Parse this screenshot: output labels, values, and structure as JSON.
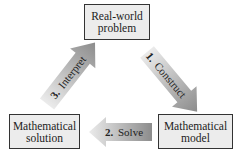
{
  "nodes": {
    "top": {
      "line1": "Real-world",
      "line2": "problem"
    },
    "right": {
      "line1": "Mathematical",
      "line2": "model"
    },
    "left": {
      "line1": "Mathematical",
      "line2": "solution"
    }
  },
  "arrows": {
    "construct": {
      "num": "1.",
      "label": "Construct"
    },
    "solve": {
      "num": "2.",
      "label": "Solve"
    },
    "interpret": {
      "num": "3.",
      "label": "Interpret"
    }
  },
  "colors": {
    "box_fill": "#ececec",
    "box_border": "#333333",
    "arrow_dark": "#8a8a8a",
    "arrow_light": "#e6e6e6"
  }
}
